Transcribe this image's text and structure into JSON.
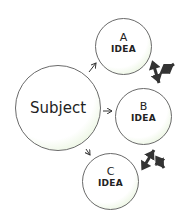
{
  "diagram": {
    "type": "mind-map",
    "central": {
      "label": "Subject"
    },
    "nodes": [
      {
        "letter": "A",
        "label": "IDEA"
      },
      {
        "letter": "B",
        "label": "IDEA"
      },
      {
        "letter": "C",
        "label": "IDEA"
      }
    ],
    "edges": [
      {
        "from": "Subject",
        "to": "A",
        "style": "thin-arrow"
      },
      {
        "from": "Subject",
        "to": "B",
        "style": "thin-arrow"
      },
      {
        "from": "Subject",
        "to": "C",
        "style": "thin-arrow"
      },
      {
        "from": "A",
        "to": "B",
        "style": "bold-double-arrow"
      },
      {
        "from": "B",
        "to": "C",
        "style": "bold-double-arrow"
      }
    ],
    "colors": {
      "stroke": "#6a6a6a",
      "fill": "#ffffff",
      "glow": "#cfe8bf",
      "arrow": "#333333"
    }
  }
}
